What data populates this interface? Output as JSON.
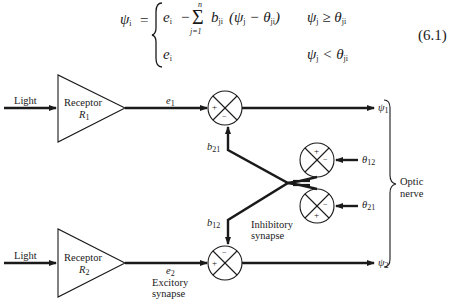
{
  "equation": {
    "lhs": "ψ",
    "lhs_sub": "i",
    "equals": "=",
    "case1_expr_e": "e",
    "case1_expr_e_sub": "i",
    "case1_minus": "−",
    "sum_symbol": "Σ",
    "sum_upper": "n",
    "sum_lower": "j=1",
    "case1_b": "b",
    "case1_b_sub": "ji",
    "case1_paren_open": "(ψ",
    "case1_psi_sub": "j",
    "case1_minus2": " − θ",
    "case1_theta_sub": "ji",
    "case1_paren_close": ")",
    "case1_cond_psi": "ψ",
    "case1_cond_psi_sub": "j",
    "case1_cond_op": " ≥ θ",
    "case1_cond_theta_sub": "ji",
    "case2_expr_e": "e",
    "case2_expr_e_sub": "i",
    "case2_cond_psi": "ψ",
    "case2_cond_psi_sub": "j",
    "case2_cond_op": " < θ",
    "case2_cond_theta_sub": "ji",
    "number": "(6.1)"
  },
  "diagram": {
    "input_top": "Light",
    "input_bottom": "Light",
    "receptor_top": {
      "label": "Receptor",
      "symbol": "R",
      "sub": "1"
    },
    "receptor_bottom": {
      "label": "Receptor",
      "symbol": "R",
      "sub": "2"
    },
    "signal_e1": {
      "symbol": "e",
      "sub": "1"
    },
    "signal_e2": {
      "symbol": "e",
      "sub": "2"
    },
    "weight_b21": {
      "symbol": "b",
      "sub": "21"
    },
    "weight_b12": {
      "symbol": "b",
      "sub": "12"
    },
    "threshold_12": {
      "symbol": "θ",
      "sub": "12"
    },
    "threshold_21": {
      "symbol": "θ",
      "sub": "21"
    },
    "output_psi1": {
      "symbol": "ψ",
      "sub": "1"
    },
    "output_psi2": {
      "symbol": "ψ",
      "sub": "2"
    },
    "inhibitory_label_1": "Inhibitory",
    "inhibitory_label_2": "synapse",
    "excitory_label_1": "Excitory",
    "excitory_label_2": "synapse",
    "optic_label_1": "Optic",
    "optic_label_2": "nerve",
    "plus": "+",
    "minus": "−"
  }
}
